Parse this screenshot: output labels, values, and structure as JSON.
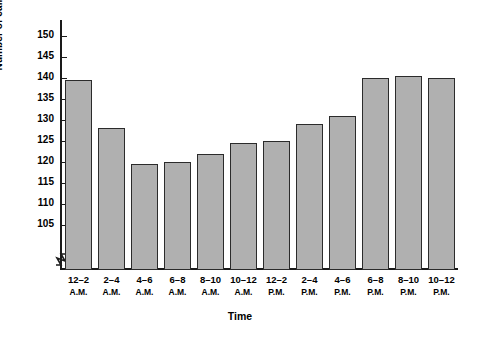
{
  "chart_data": {
    "type": "bar",
    "title": "",
    "xlabel": "Time",
    "ylabel": "Number of calls received",
    "ylim": [
      105,
      152
    ],
    "y_axis_break": true,
    "grid": false,
    "legend": null,
    "y_ticks": [
      105,
      110,
      115,
      120,
      125,
      130,
      135,
      140,
      145,
      150
    ],
    "categories": [
      "12–2 A.M.",
      "2–4 A.M.",
      "4–6 A.M.",
      "6–8 A.M.",
      "8–10 A.M.",
      "10–12 A.M.",
      "12–2 P.M.",
      "2–4 P.M.",
      "4–6 P.M.",
      "6–8 P.M.",
      "8–10 P.M.",
      "10–12 P.M."
    ],
    "category_ranges": [
      "12–2",
      "2–4",
      "4–6",
      "6–8",
      "8–10",
      "10–12",
      "12–2",
      "2–4",
      "4–6",
      "6–8",
      "8–10",
      "10–12"
    ],
    "category_periods": [
      "A.M.",
      "A.M.",
      "A.M.",
      "A.M.",
      "A.M.",
      "A.M.",
      "P.M.",
      "P.M.",
      "P.M.",
      "P.M.",
      "P.M.",
      "P.M."
    ],
    "values": [
      139.5,
      128,
      119.5,
      120,
      122,
      124.5,
      125,
      129,
      131,
      140,
      140.5,
      140
    ],
    "bar_fill_color": "#b0b0b0",
    "bar_edge_color": "#2b2b2b",
    "axis_color": "#1a1a1a"
  }
}
